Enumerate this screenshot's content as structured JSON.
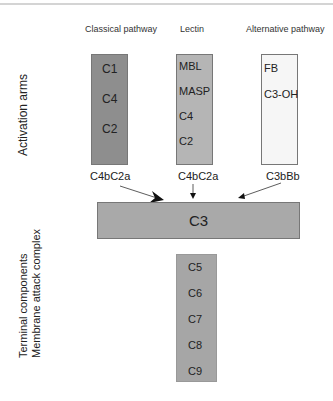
{
  "diagram": {
    "section_labels": {
      "activation": "Activation arms",
      "terminal_line1": "Terminal components",
      "terminal_line2": "Membrane attack complex"
    },
    "pathways": [
      {
        "name": "Classical pathway",
        "components": [
          "C1",
          "C4",
          "C2"
        ],
        "convertase": "C4bC2a",
        "color": "#8e8e8e"
      },
      {
        "name": "Lectin",
        "components": [
          "MBL",
          "MASP",
          "C4",
          "C2"
        ],
        "convertase": "C4bC2a",
        "color": "#b5b5b5"
      },
      {
        "name": "Alternative pathway",
        "components": [
          "FB",
          "C3-OH"
        ],
        "convertase": "C3bBb",
        "color": "#f6f6f6"
      }
    ],
    "central": {
      "label": "C3",
      "color": "#a9a9a9"
    },
    "terminal": {
      "components": [
        "C5",
        "C6",
        "C7",
        "C8",
        "C9"
      ],
      "color": "#a6a6a6"
    }
  }
}
